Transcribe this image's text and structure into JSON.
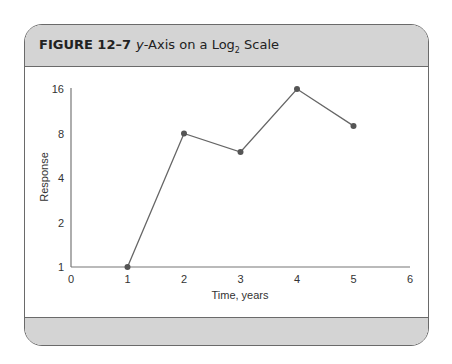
{
  "figure": {
    "number_label": "FIGURE 12–7",
    "title_italic": "y",
    "title_rest_1": "-Axis on a Log",
    "title_sub": "2",
    "title_rest_2": " Scale"
  },
  "chart_data": {
    "type": "line",
    "xlabel": "Time, years",
    "ylabel": "Response",
    "x": [
      1,
      2,
      3,
      4,
      5
    ],
    "values": [
      1,
      8,
      6,
      16,
      9
    ],
    "xlim": [
      0,
      6
    ],
    "ylim": [
      1,
      16
    ],
    "yscale": "log2",
    "x_ticks": [
      "0",
      "1",
      "2",
      "3",
      "4",
      "5",
      "6"
    ],
    "y_ticks": [
      "1",
      "2",
      "4",
      "8",
      "16"
    ],
    "grid": false,
    "legend": null,
    "colors": {
      "line": "#666666",
      "marker": "#555555",
      "axis": "#777777"
    }
  }
}
